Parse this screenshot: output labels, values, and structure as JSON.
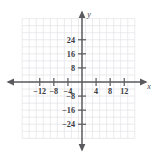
{
  "figure": {
    "width": 157,
    "height": 155,
    "background_color": "#ffffff"
  },
  "axes": {
    "x_axis_label": "x",
    "y_axis_label": "y",
    "axis_color": "#5a5a5e",
    "grid_color": "#e2e2e6",
    "label_color": "#3b3b3f"
  },
  "chart_data": {
    "type": "scatter",
    "title": "",
    "subtitle": "",
    "xlabel": "x",
    "ylabel": "y",
    "xlim": [
      -16,
      16
    ],
    "ylim": [
      -32,
      32
    ],
    "x_tick_labels": [
      "-12",
      "-8",
      "-4",
      "4",
      "8",
      "12"
    ],
    "x_tick_values": [
      -12,
      -8,
      -4,
      4,
      8,
      12
    ],
    "y_tick_labels": [
      "24",
      "16",
      "8",
      "-8",
      "-16",
      "-24"
    ],
    "y_tick_values": [
      24,
      16,
      8,
      -8,
      -16,
      -24
    ],
    "x_major_step": 4,
    "y_major_step": 8,
    "x_grid_step": 2,
    "y_grid_step": 4,
    "grid": true,
    "legend": false,
    "legend_position": "none",
    "series": [],
    "annotations": [],
    "origin_label": ""
  },
  "ticks": {
    "x": [
      {
        "label": "-12",
        "value": -12
      },
      {
        "label": "-8",
        "value": -8
      },
      {
        "label": "-4",
        "value": -4
      },
      {
        "label": "4",
        "value": 4
      },
      {
        "label": "8",
        "value": 8
      },
      {
        "label": "12",
        "value": 12
      }
    ],
    "y": [
      {
        "label": "24",
        "value": 24
      },
      {
        "label": "16",
        "value": 16
      },
      {
        "label": "8",
        "value": 8
      },
      {
        "label": "-8",
        "value": -8
      },
      {
        "label": "-16",
        "value": -16
      },
      {
        "label": "-24",
        "value": -24
      }
    ]
  }
}
